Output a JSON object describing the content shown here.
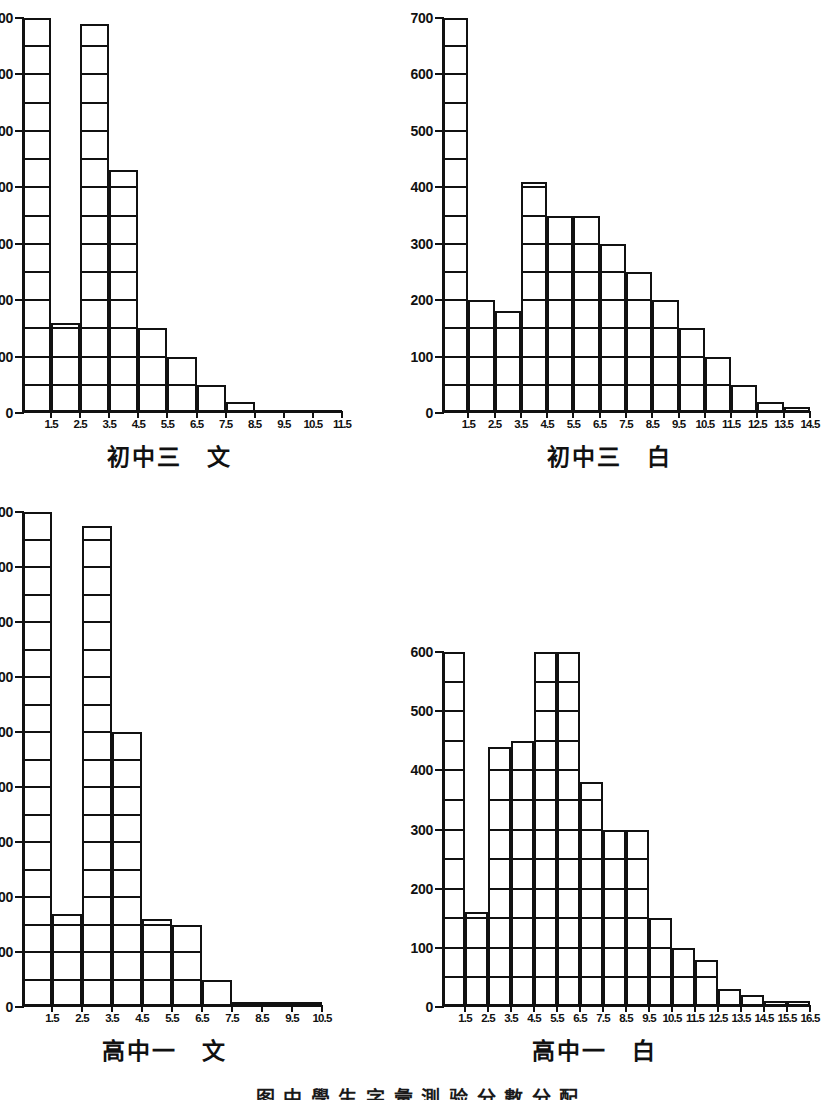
{
  "page": {
    "bottom_caption": "图  中 學 生 字 彙 測 验 分 數 分 配"
  },
  "charts": [
    {
      "id": "chart-junior3-literary",
      "caption": "初中三　文",
      "chart_data": {
        "type": "bar",
        "title": "初中三 文",
        "xlabel": "",
        "ylabel": "",
        "ylim": [
          0,
          700
        ],
        "ytick_step": 100,
        "yticks": [
          0,
          100,
          200,
          300,
          400,
          500,
          600,
          700
        ],
        "grid": true,
        "cell_height": 50,
        "categories": [
          "1.5",
          "2.5",
          "3.5",
          "4.5",
          "5.5",
          "6.5",
          "7.5",
          "8.5",
          "9.5",
          "10.5",
          "11.5"
        ],
        "values": [
          700,
          160,
          690,
          430,
          150,
          100,
          50,
          20,
          5,
          5,
          5
        ]
      }
    },
    {
      "id": "chart-junior3-vernacular",
      "caption": "初中三　白",
      "chart_data": {
        "type": "bar",
        "title": "初中三 白",
        "xlabel": "",
        "ylabel": "",
        "ylim": [
          0,
          700
        ],
        "ytick_step": 100,
        "yticks": [
          0,
          100,
          200,
          300,
          400,
          500,
          600,
          700
        ],
        "grid": true,
        "cell_height": 50,
        "categories": [
          "1.5",
          "2.5",
          "3.5",
          "4.5",
          "5.5",
          "6.5",
          "7.5",
          "8.5",
          "9.5",
          "10.5",
          "11.5",
          "12.5",
          "13.5",
          "14.5"
        ],
        "values": [
          700,
          200,
          180,
          410,
          350,
          350,
          300,
          250,
          200,
          150,
          100,
          50,
          20,
          10
        ]
      }
    },
    {
      "id": "chart-senior1-literary",
      "caption": "高中一　文",
      "chart_data": {
        "type": "bar",
        "title": "高中一 文",
        "xlabel": "",
        "ylabel": "",
        "ylim": [
          0,
          900
        ],
        "ytick_step": 100,
        "yticks": [
          0,
          100,
          200,
          300,
          400,
          500,
          600,
          700,
          800,
          900
        ],
        "grid": true,
        "cell_height": 50,
        "categories": [
          "1.5",
          "2.5",
          "3.5",
          "4.5",
          "5.5",
          "6.5",
          "7.5",
          "8.5",
          "9.5",
          "10.5"
        ],
        "values": [
          900,
          170,
          875,
          500,
          160,
          150,
          50,
          10,
          10,
          10
        ]
      }
    },
    {
      "id": "chart-senior1-vernacular",
      "caption": "高中一　白",
      "chart_data": {
        "type": "bar",
        "title": "高中一 白",
        "xlabel": "",
        "ylabel": "",
        "ylim": [
          0,
          600
        ],
        "ytick_step": 100,
        "yticks": [
          0,
          100,
          200,
          300,
          400,
          500,
          600
        ],
        "grid": true,
        "cell_height": 50,
        "categories": [
          "1.5",
          "2.5",
          "3.5",
          "4.5",
          "5.5",
          "6.5",
          "7.5",
          "8.5",
          "9.5",
          "10.5",
          "11.5",
          "12.5",
          "13.5",
          "14.5",
          "15.5",
          "16.5"
        ],
        "values": [
          600,
          160,
          440,
          450,
          600,
          600,
          380,
          300,
          300,
          150,
          100,
          80,
          30,
          20,
          10,
          10
        ]
      }
    }
  ]
}
